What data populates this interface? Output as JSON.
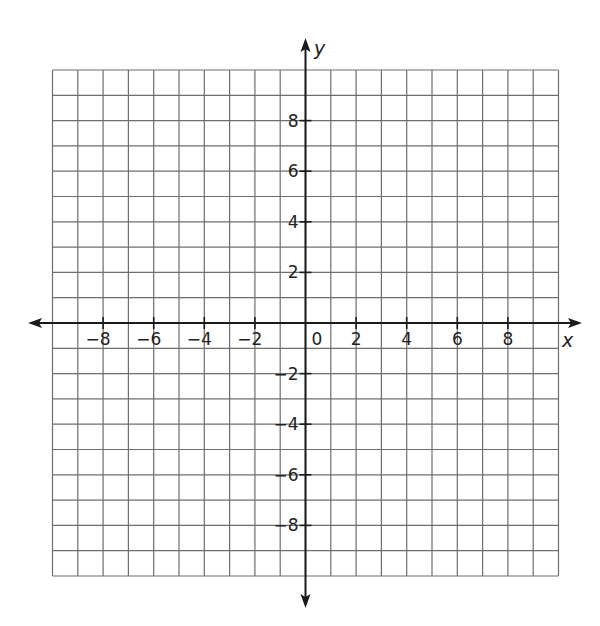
{
  "chart_data": {
    "type": "scatter",
    "title": "",
    "xlabel": "x",
    "ylabel": "y",
    "xlim": [
      -10,
      10
    ],
    "ylim": [
      -10,
      10
    ],
    "grid": true,
    "grid_step": 1,
    "x_ticks": [
      -8,
      -6,
      -4,
      -2,
      2,
      4,
      6,
      8
    ],
    "x_tick_labels": [
      "−8",
      "−6",
      "−4",
      "−2",
      "2",
      "4",
      "6",
      "8"
    ],
    "y_ticks": [
      8,
      6,
      4,
      2,
      -2,
      -4,
      -6,
      -8
    ],
    "y_tick_labels": [
      "8",
      "6",
      "4",
      "2",
      "−2",
      "−4",
      "−6",
      "−8"
    ],
    "origin_label": "0",
    "series": [],
    "legend": null
  },
  "colors": {
    "grid": "#6e6e6e",
    "axis": "#1a1a1a",
    "text": "#222222",
    "background": "#ffffff"
  }
}
